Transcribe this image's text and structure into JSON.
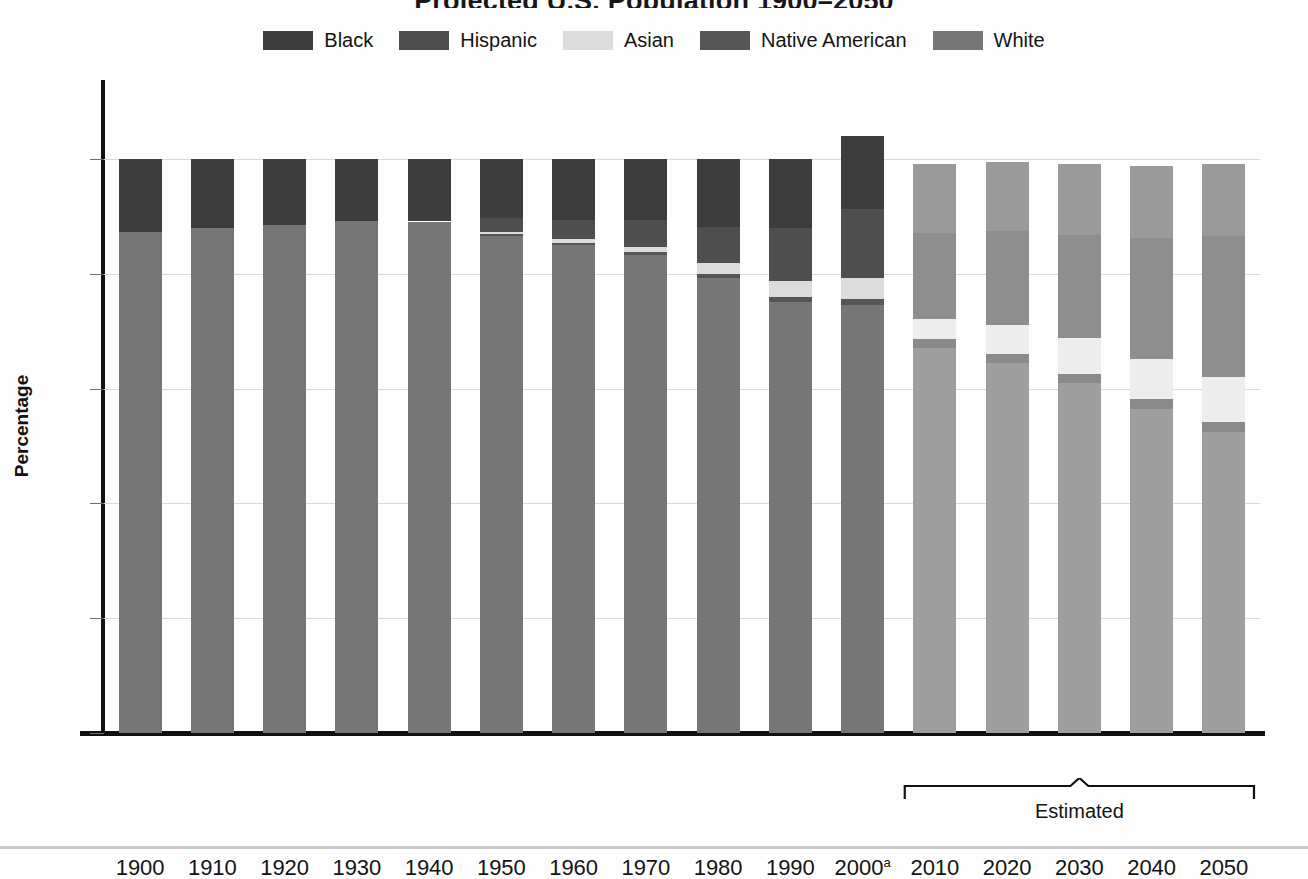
{
  "title": "Projected U.S. Population 1900–2050",
  "legend": {
    "position": "top-center",
    "items": [
      {
        "label": "Black",
        "color": "#3d3d3d",
        "key": "black"
      },
      {
        "label": "Hispanic",
        "color": "#4e4e4e",
        "key": "hispanic"
      },
      {
        "label": "Asian",
        "color": "#dcdcdc",
        "key": "asian"
      },
      {
        "label": "Native American",
        "color": "#565656",
        "key": "native_american"
      },
      {
        "label": "White",
        "color": "#767676",
        "key": "white"
      }
    ]
  },
  "axes": {
    "ylabel": "Percentage",
    "yticks": [
      "0",
      "20",
      "40",
      "60",
      "80",
      "100"
    ],
    "ylim": [
      0,
      108
    ],
    "grid": "horizontal-dotted"
  },
  "annotations": {
    "estimated_label": "Estimated",
    "estimated_years": [
      "2010",
      "2020",
      "2030",
      "2040",
      "2050"
    ],
    "footnote_marker": "a"
  },
  "chart_data": {
    "type": "bar",
    "subtype": "stacked-vertical-100pct",
    "title": "Projected U.S. Population 1900–2050",
    "xlabel": "",
    "ylabel": "Percentage",
    "ylim": [
      0,
      108
    ],
    "grid": true,
    "legend_position": "top-center",
    "categories": [
      "1900",
      "1910",
      "1920",
      "1930",
      "1940",
      "1950",
      "1960",
      "1970",
      "1980",
      "1990",
      "2000",
      "2010",
      "2020",
      "2030",
      "2040",
      "2050"
    ],
    "category_labels": [
      "1900",
      "1910",
      "1920",
      "1930",
      "1940",
      "1950",
      "1960",
      "1970",
      "1980",
      "1990",
      "2000a",
      "2010",
      "2020",
      "2030",
      "2040",
      "2050"
    ],
    "estimated_from": "2010",
    "stack_order_bottom_to_top": [
      "White",
      "Native American",
      "Asian",
      "Hispanic",
      "Black"
    ],
    "series": [
      {
        "name": "White",
        "color": "#767676",
        "faded_color": "#9e9e9e",
        "values": [
          87.2,
          88.0,
          88.5,
          89.2,
          89.1,
          86.5,
          85.0,
          83.3,
          79.2,
          75.0,
          74.5,
          67.0,
          64.5,
          61.0,
          56.5,
          52.5
        ]
      },
      {
        "name": "Native American",
        "color": "#565656",
        "faded_color": "#8a8a8a",
        "values": [
          0.0,
          0.0,
          0.0,
          0.0,
          0.0,
          0.4,
          0.4,
          0.5,
          0.7,
          0.9,
          1.1,
          1.6,
          1.6,
          1.6,
          1.6,
          1.6
        ]
      },
      {
        "name": "Asian",
        "color": "#dcdcdc",
        "faded_color": "#ededed",
        "values": [
          0.0,
          0.0,
          0.0,
          0.0,
          0.0,
          0.4,
          0.6,
          0.9,
          1.9,
          2.9,
          3.7,
          3.6,
          5.0,
          6.2,
          7.0,
          7.9
        ]
      },
      {
        "name": "Hispanic",
        "color": "#4e4e4e",
        "faded_color": "#8e8e8e",
        "values": [
          0.0,
          0.0,
          0.0,
          0.0,
          0.0,
          2.4,
          3.4,
          4.6,
          6.3,
          9.1,
          12.0,
          14.9,
          16.3,
          18.0,
          21.2,
          24.5
        ]
      },
      {
        "name": "Black",
        "color": "#3d3d3d",
        "faded_color": "#9a9a9a",
        "values": [
          12.8,
          12.0,
          11.5,
          10.8,
          10.9,
          10.3,
          10.6,
          10.7,
          11.9,
          12.1,
          12.7,
          12.0,
          12.0,
          12.3,
          12.5,
          12.6
        ]
      }
    ],
    "bar_totals": [
      100.0,
      100.0,
      100.0,
      100.0,
      100.0,
      100.0,
      100.0,
      100.0,
      100.0,
      100.0,
      104.0,
      99.1,
      99.4,
      99.1,
      98.8,
      99.1
    ]
  }
}
